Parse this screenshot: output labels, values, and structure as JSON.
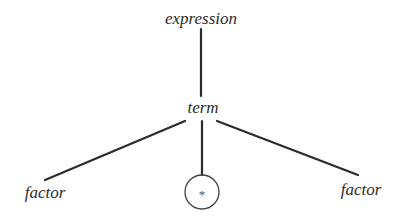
{
  "diagram": {
    "type": "parse-tree",
    "colors": {
      "line": "#2b2b2b",
      "text": "#2b2b2b",
      "circle": "#444444",
      "background": "#ffffff"
    },
    "nodes": {
      "root": {
        "label": "expression",
        "x": 201,
        "y": 24
      },
      "term": {
        "label": "term",
        "x": 203,
        "y": 113
      },
      "left_factor": {
        "label": "factor",
        "x": 45,
        "y": 198
      },
      "operator": {
        "label": "*",
        "x": 202,
        "y": 192,
        "shape": "circle",
        "r": 17
      },
      "right_factor": {
        "label": "factor",
        "x": 361,
        "y": 195
      }
    },
    "edges": [
      {
        "from": "root",
        "to": "term"
      },
      {
        "from": "term",
        "to": "left_factor"
      },
      {
        "from": "term",
        "to": "operator"
      },
      {
        "from": "term",
        "to": "right_factor"
      }
    ]
  }
}
